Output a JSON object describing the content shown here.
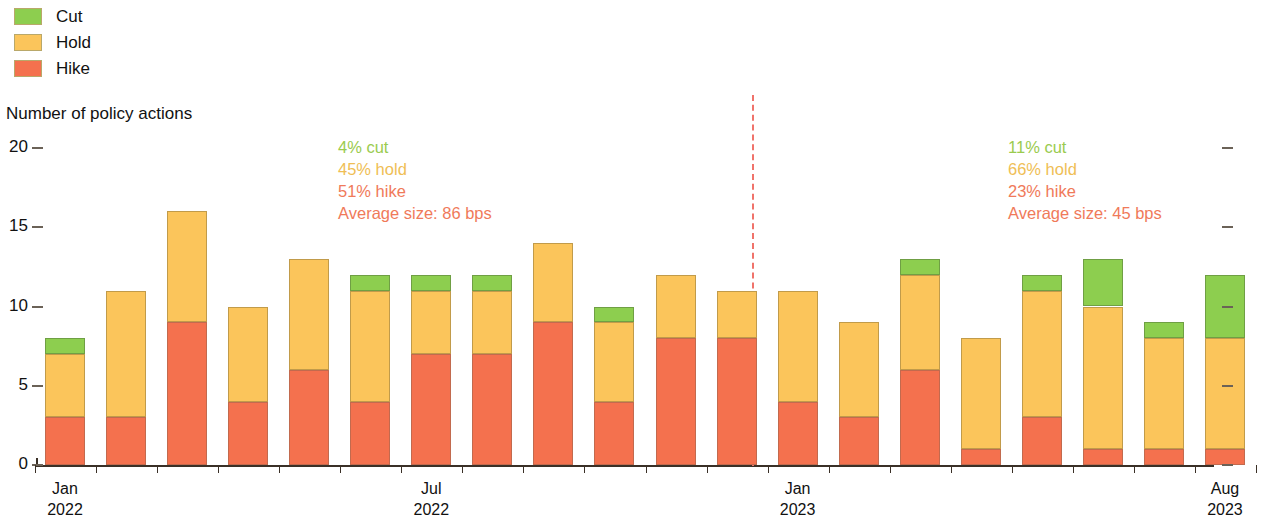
{
  "legend": {
    "items": [
      {
        "label": "Cut",
        "color": "#8DCE4F",
        "key": "cut"
      },
      {
        "label": "Hold",
        "color": "#FBC55B",
        "key": "hold"
      },
      {
        "label": "Hike",
        "color": "#F4714E",
        "key": "hike"
      }
    ]
  },
  "axis_title": "Number of policy actions",
  "annotations": [
    {
      "cut": "4% cut",
      "hold": "45% hold",
      "hike": "51% hike",
      "average": "Average size: 86 bps"
    },
    {
      "cut": "11% cut",
      "hold": "66% hold",
      "hike": "23% hike",
      "average": "Average size: 45 bps"
    }
  ],
  "xlabels": [
    {
      "month": "Jan",
      "year": "2022"
    },
    {
      "month": "Jul",
      "year": "2022"
    },
    {
      "month": "Jan",
      "year": "2023"
    },
    {
      "month": "Aug",
      "year": "2023"
    }
  ],
  "chart_data": {
    "type": "bar",
    "stacked": true,
    "title": "",
    "subtitle": "",
    "xlabel": "",
    "ylabel": "Number of policy actions",
    "ylim": [
      0,
      20
    ],
    "yticks": [
      0,
      5,
      10,
      15,
      20
    ],
    "ytick_labels": [
      "0",
      "5",
      "10",
      "15",
      "20"
    ],
    "grid": false,
    "legend_position": "top-left",
    "categories": [
      "Jan 2022",
      "Feb 2022",
      "Mar 2022",
      "Apr 2022",
      "May 2022",
      "Jun 2022",
      "Jul 2022",
      "Aug 2022",
      "Sep 2022",
      "Oct 2022",
      "Nov 2022",
      "Dec 2022",
      "Jan 2023",
      "Feb 2023",
      "Mar 2023",
      "Apr 2023",
      "May 2023",
      "Jun 2023",
      "Jul 2023",
      "Aug 2023"
    ],
    "series": [
      {
        "name": "Hike",
        "color": "#F4714E",
        "values": [
          3,
          3,
          9,
          4,
          6,
          4,
          7,
          7,
          9,
          4,
          8,
          8,
          4,
          3,
          6,
          1,
          3,
          1,
          1,
          1
        ]
      },
      {
        "name": "Hold",
        "color": "#FBC55B",
        "values": [
          4,
          8,
          7,
          6,
          7,
          7,
          4,
          4,
          5,
          5,
          4,
          3,
          7,
          6,
          6,
          7,
          8,
          9,
          7,
          7
        ]
      },
      {
        "name": "Cut",
        "color": "#8DCE4F",
        "values": [
          1,
          0,
          0,
          0,
          0,
          1,
          1,
          1,
          0,
          1,
          0,
          0,
          0,
          0,
          1,
          0,
          1,
          3,
          1,
          4
        ]
      }
    ],
    "totals": [
      8,
      11,
      16,
      10,
      13,
      12,
      12,
      12,
      14,
      10,
      12,
      11,
      11,
      9,
      13,
      8,
      12,
      13,
      9,
      12
    ],
    "annotations": [
      {
        "text": "4% cut / 45% hold / 51% hike / Average size: 86 bps",
        "period": "2022"
      },
      {
        "text": "11% cut / 66% hold / 23% hike / Average size: 45 bps",
        "period": "2023"
      }
    ],
    "divider": {
      "after_category": "Dec 2022",
      "style": "dashed",
      "color": "#f0736b"
    }
  }
}
